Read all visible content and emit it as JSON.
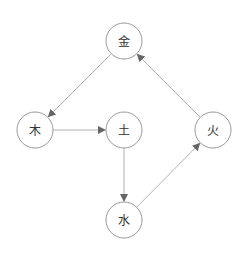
{
  "diagram": {
    "type": "directed-graph",
    "colors": {
      "node_stroke": "#9a9a9a",
      "edge": "#b0b0b0",
      "arrow": "#666666",
      "text": "#333333"
    },
    "nodes": [
      {
        "id": "metal",
        "label": "金",
        "cx": 124,
        "cy": 41,
        "r": 18
      },
      {
        "id": "wood",
        "label": "木",
        "cx": 35,
        "cy": 130,
        "r": 18
      },
      {
        "id": "earth",
        "label": "土",
        "cx": 124,
        "cy": 130,
        "r": 18
      },
      {
        "id": "fire",
        "label": "火",
        "cx": 213,
        "cy": 130,
        "r": 18
      },
      {
        "id": "water",
        "label": "水",
        "cx": 124,
        "cy": 220,
        "r": 18
      }
    ],
    "edges": [
      {
        "from": "metal",
        "to": "wood"
      },
      {
        "from": "wood",
        "to": "earth"
      },
      {
        "from": "earth",
        "to": "water"
      },
      {
        "from": "water",
        "to": "fire"
      },
      {
        "from": "fire",
        "to": "metal"
      }
    ]
  }
}
